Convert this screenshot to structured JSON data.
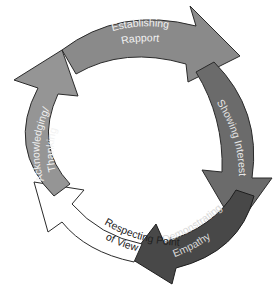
{
  "diagram": {
    "type": "cycle",
    "direction": "clockwise",
    "steps": [
      {
        "id": "establishing-rapport",
        "line1": "Establishing",
        "line2": "Rapport",
        "fill": "#8a8a8a",
        "text_color": "#f2f2f2",
        "stroke": "#2a2a2a"
      },
      {
        "id": "showing-interest",
        "line1": "Showing Interest",
        "fill": "#6b6b6b",
        "text_color": "#e6e6e6",
        "stroke": "#2a2a2a"
      },
      {
        "id": "demonstrating-empathy",
        "line1": "Demonstrating",
        "line2": "Empathy",
        "fill": "#484848",
        "text_color": "#d8d8d8",
        "stroke": "#1e1e1e"
      },
      {
        "id": "respecting-point-of-view",
        "line1": "Respecting Point",
        "line2": "of View",
        "fill": "#ffffff",
        "text_color": "#222222",
        "stroke": "#2a2a2a"
      },
      {
        "id": "acknowledging-thanking",
        "line1": "Acknowledging/",
        "line2": "Thanking",
        "fill": "#959595",
        "text_color": "#f2f2f2",
        "stroke": "#2a2a2a"
      }
    ]
  }
}
